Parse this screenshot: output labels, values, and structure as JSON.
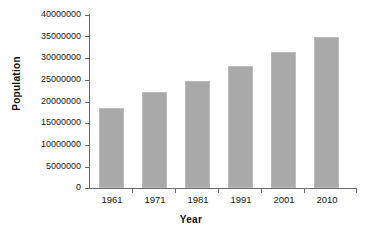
{
  "chart_data": {
    "type": "bar",
    "title": "",
    "xlabel": "Year",
    "ylabel": "Population",
    "categories": [
      "1961",
      "1971",
      "1981",
      "1991",
      "2001",
      "2010"
    ],
    "values": [
      18600000,
      22200000,
      24800000,
      28100000,
      31400000,
      35000000
    ],
    "series": [
      {
        "name": "Population",
        "values": [
          18600000,
          22200000,
          24800000,
          28100000,
          31400000,
          35000000
        ]
      }
    ],
    "ylim": [
      0,
      40000000
    ],
    "ytick_values": [
      0,
      5000000,
      10000000,
      15000000,
      20000000,
      25000000,
      30000000,
      35000000,
      40000000
    ],
    "ytick_labels": [
      "0",
      "5000000",
      "10000000",
      "15000000",
      "20000000",
      "25000000",
      "30000000",
      "35000000",
      "40000000"
    ],
    "grid": false,
    "legend": false,
    "legend_position": "none",
    "bar_color": "#a9a9a9",
    "axis_color": "#6b6b6b",
    "background_color": "#ffffff"
  }
}
